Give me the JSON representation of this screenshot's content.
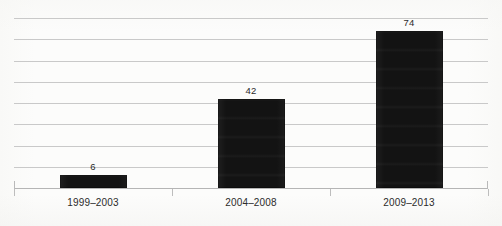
{
  "chart_data": {
    "type": "bar",
    "title": "",
    "subtitle": "",
    "xlabel": "",
    "ylabel": "",
    "categories": [
      "1999–2003",
      "2004–2008",
      "2009–2013"
    ],
    "values": [
      6,
      42,
      74
    ],
    "value_labels": [
      "6",
      "42",
      "74"
    ],
    "ylim": [
      0,
      80
    ],
    "y_tick_step": 10,
    "y_ticks": [
      0,
      10,
      20,
      30,
      40,
      50,
      60,
      70,
      80
    ],
    "y_tick_labels_visible": false,
    "grid": true,
    "grid_orientation": "horizontal",
    "gridline_count": 9,
    "legend": null,
    "legend_position": "none",
    "series": [
      {
        "name": "",
        "values": [
          6,
          42,
          74
        ]
      }
    ],
    "annotations": [
      {
        "text": "6",
        "category": "1999–2003",
        "position": "above-bar"
      },
      {
        "text": "42",
        "category": "2004–2008",
        "position": "above-bar"
      },
      {
        "text": "74",
        "category": "2009–2013",
        "position": "above-bar"
      }
    ]
  },
  "style": {
    "bar_color": "#131313",
    "gridline_color": "#c9c9c9",
    "axis_color": "#b5b5b5",
    "tick_color": "#bdbdbd",
    "label_color": "#2b2b2b",
    "value_label_color": "#2a2a2a",
    "background_color": "#fcfcfb"
  }
}
